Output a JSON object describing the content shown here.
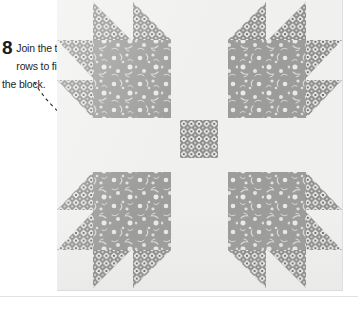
{
  "instruction": {
    "step_number": "8",
    "text": "Join the three rows to finish the block.",
    "pointer_icon": "dashed-curved-arrow-icon"
  },
  "block": {
    "name": "bears-paw-quilt-block",
    "layout": "3x3 grid: four paw units at the corners, background sashing strips between them, one pieced square at the center",
    "fabrics": {
      "background": "#f0f0ee",
      "floral_print": "#9a9a9a",
      "floral_motif": "#e9e9e7",
      "geometric_print": "#8e8e8e",
      "geometric_motif": "#fbfbfa"
    },
    "units": [
      {
        "name": "paw-top-left",
        "orientation": "claws point up and left"
      },
      {
        "name": "paw-top-right",
        "orientation": "claws point up and right"
      },
      {
        "name": "paw-bottom-left",
        "orientation": "claws point down and left"
      },
      {
        "name": "paw-bottom-right",
        "orientation": "claws point down and right"
      },
      {
        "name": "center-square",
        "orientation": "geometric print square at block centre"
      }
    ],
    "paw_parts": {
      "large_square": "floral print square",
      "claws": "four half-square triangles per paw",
      "corner_square": "background square at the outer corner"
    }
  }
}
